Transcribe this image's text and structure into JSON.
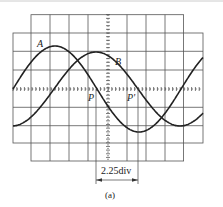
{
  "figure": {
    "type": "oscilloscope-waveform-diagram",
    "caption": "(a)",
    "grid": {
      "divisions_x_wide": 10,
      "divisions_x_narrow": 8,
      "divisions_y": 8,
      "minor_ticks_per_div": 5
    },
    "waveforms": [
      {
        "name": "A",
        "label": "A",
        "color": "#222222"
      },
      {
        "name": "B",
        "label": "B",
        "color": "#222222"
      }
    ],
    "points": [
      {
        "name": "P",
        "label": "P"
      },
      {
        "name": "P-prime",
        "label": "P'"
      }
    ],
    "dimension": {
      "label": "2.25div",
      "value_div": 2.25
    },
    "colors": {
      "grid": "#555555",
      "trace": "#222222",
      "background": "#ffffff"
    }
  }
}
